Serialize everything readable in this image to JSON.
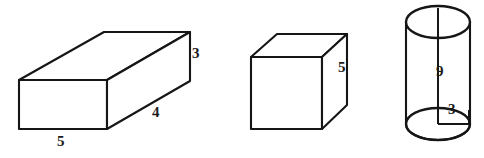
{
  "figure": {
    "background_color": "#ffffff",
    "stroke_color": "#161616",
    "width": 484,
    "height": 158,
    "shapes": [
      {
        "id": "rectangular-prism",
        "name": "rectangular prism",
        "labels": [
          {
            "id": "prism-width-label",
            "text": "5",
            "x": 57,
            "y": 134,
            "edge": "front-bottom"
          },
          {
            "id": "prism-depth-label",
            "text": "4",
            "x": 152,
            "y": 105,
            "edge": "bottom-right-receding"
          },
          {
            "id": "prism-height-label",
            "text": "3",
            "x": 192,
            "y": 46,
            "edge": "back-right-vertical"
          }
        ]
      },
      {
        "id": "cube",
        "name": "cube",
        "labels": [
          {
            "id": "cube-height-label",
            "text": "5",
            "x": 338,
            "y": 60,
            "edge": "right-vertical"
          }
        ]
      },
      {
        "id": "cylinder",
        "name": "cylinder",
        "labels": [
          {
            "id": "cylinder-height-label",
            "text": "9",
            "x": 436,
            "y": 64,
            "edge": "axis"
          },
          {
            "id": "cylinder-radius-label",
            "text": "3",
            "x": 448,
            "y": 102,
            "edge": "base-radius"
          }
        ]
      }
    ]
  }
}
